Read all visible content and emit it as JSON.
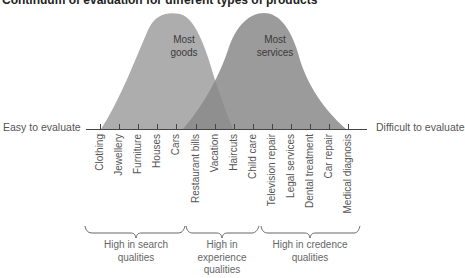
{
  "title": "Continuum of evaluation for different types of products",
  "axis": {
    "left_label": "Easy to evaluate",
    "right_label": "Difficult to evaluate"
  },
  "curves": [
    {
      "label_line1": "Most",
      "label_line2": "goods",
      "color": "#a9a9a9"
    },
    {
      "label_line1": "Most",
      "label_line2": "services",
      "color": "#8f8f8f"
    }
  ],
  "ticks": [
    "Clothing",
    "Jewellery",
    "Furniture",
    "Houses",
    "Cars",
    "Restaurant bills",
    "Vacation",
    "Haircuts",
    "Child care",
    "Television repair",
    "Legal services",
    "Dental treatment",
    "Car repair",
    "Medical diagnosis"
  ],
  "groups": [
    {
      "line1": "High in search",
      "line2": "qualities",
      "line3": ""
    },
    {
      "line1": "High in",
      "line2": "experience",
      "line3": "qualities"
    },
    {
      "line1": "High in credence",
      "line2": "qualities",
      "line3": ""
    }
  ]
}
